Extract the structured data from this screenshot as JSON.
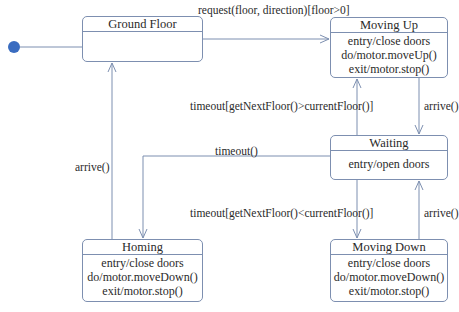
{
  "diagram": {
    "type": "uml-state-machine",
    "colors": {
      "line": "#7d8fb0",
      "initial_dot": "#3a6cc0",
      "text": "#2a2a2a"
    },
    "initial_state": "Ground Floor",
    "states": {
      "ground_floor": {
        "name": "Ground Floor",
        "actions": []
      },
      "moving_up": {
        "name": "Moving Up",
        "actions": [
          "entry/close doors",
          "do/motor.moveUp()",
          "exit/motor.stop()"
        ]
      },
      "waiting": {
        "name": "Waiting",
        "actions": [
          "entry/open doors"
        ]
      },
      "homing": {
        "name": "Homing",
        "actions": [
          "entry/close doors",
          "do/motor.moveDown()",
          "exit/motor.stop()"
        ]
      },
      "moving_down": {
        "name": "Moving Down",
        "actions": [
          "entry/close doors",
          "do/motor.moveDown()",
          "exit/motor.stop()"
        ]
      }
    },
    "transitions": {
      "ground_to_moving_up": {
        "from": "Ground Floor",
        "to": "Moving Up",
        "label": "request(floor, direction)[floor>0]"
      },
      "moving_up_to_waiting": {
        "from": "Moving Up",
        "to": "Waiting",
        "label": "arrive()"
      },
      "waiting_to_moving_up": {
        "from": "Waiting",
        "to": "Moving Up",
        "label": "timeout[getNextFloor()>currentFloor()]"
      },
      "waiting_to_homing": {
        "from": "Waiting",
        "to": "Homing",
        "label": "timeout()"
      },
      "homing_to_ground": {
        "from": "Homing",
        "to": "Ground Floor",
        "label": "arrive()"
      },
      "waiting_to_moving_down": {
        "from": "Waiting",
        "to": "Moving Down",
        "label": "timeout[getNextFloor()<currentFloor()]"
      },
      "moving_down_to_waiting": {
        "from": "Moving Down",
        "to": "Waiting",
        "label": "arrive()"
      }
    }
  }
}
